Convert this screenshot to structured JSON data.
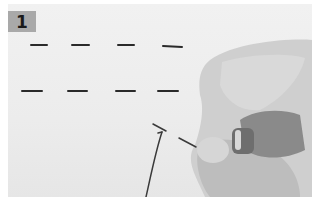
{
  "figure": {
    "step_number": "1",
    "stitch_rows": [
      {
        "y": 45,
        "stitches": [
          [
            30,
            46
          ],
          [
            72,
            88
          ],
          [
            118,
            134
          ],
          [
            162,
            180
          ]
        ]
      },
      {
        "y": 91,
        "stitches": [
          [
            22,
            42
          ],
          [
            68,
            86
          ],
          [
            116,
            134
          ],
          [
            158,
            178
          ]
        ]
      }
    ],
    "colors": {
      "badge": "#a9a9a9",
      "fabric": "#ededed",
      "thread": "#2a2a2a",
      "skin": "#c9c9c9"
    }
  }
}
